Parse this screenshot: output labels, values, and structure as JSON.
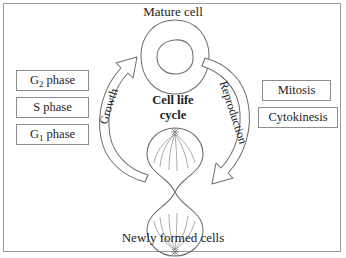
{
  "figure": {
    "title_top": "Mature cell",
    "title_bottom": "Newly formed cells",
    "center_line1": "Cell life",
    "center_line2": "cycle",
    "border_color": "#9a9a9a",
    "line_color": "#6f6f6f",
    "text_color": "#222222"
  },
  "arcs": {
    "left": {
      "label": "Growth",
      "direction": "upward",
      "description": "hollow curved arrow from dividing cell to mature cell"
    },
    "right": {
      "label": "Reproduction",
      "direction": "downward",
      "description": "hollow curved arrow from mature cell to dividing cell"
    }
  },
  "left_boxes": [
    {
      "label_main": "G",
      "label_sub": "2",
      "label_rest": " phase",
      "name": "g2-phase"
    },
    {
      "label_main": "S phase",
      "label_sub": "",
      "label_rest": "",
      "name": "s-phase"
    },
    {
      "label_main": "G",
      "label_sub": "1",
      "label_rest": " phase",
      "name": "g1-phase"
    }
  ],
  "right_boxes": [
    {
      "label": "Mitosis",
      "name": "mitosis"
    },
    {
      "label": "Cytokinesis",
      "name": "cytokinesis"
    }
  ],
  "cells": {
    "mature": {
      "name": "mature-cell",
      "shape": "oval with nucleus",
      "cx": 175,
      "cy": 57,
      "rx": 33,
      "ry": 37
    },
    "dividing": {
      "name": "dividing-cell",
      "shape": "figure-eight with spindle fibers",
      "top_lobe_cy": 155,
      "bottom_lobe_cy": 203,
      "cx": 175,
      "lobe_r": 28
    }
  }
}
